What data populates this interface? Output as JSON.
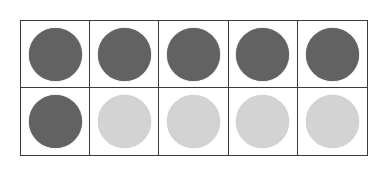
{
  "ten_frame": {
    "rows": 2,
    "columns": 5,
    "filled_count": 6,
    "empty_count": 4,
    "colors": {
      "filled": "#626262",
      "empty": "#d3d3d3",
      "border": "#3a3a3a"
    },
    "cells": [
      [
        "filled",
        "filled",
        "filled",
        "filled",
        "filled"
      ],
      [
        "filled",
        "empty",
        "empty",
        "empty",
        "empty"
      ]
    ]
  }
}
